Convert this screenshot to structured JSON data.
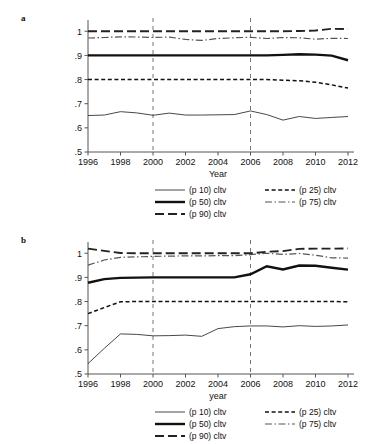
{
  "figure": {
    "panels": [
      {
        "letter": "a",
        "xlabel": "Year",
        "ylabel": "",
        "xticks": [
          "1996",
          "1998",
          "2000",
          "2002",
          "2004",
          "2006",
          "2008",
          "2010",
          "2012"
        ],
        "yticks": [
          "1",
          ".9",
          ".8",
          ".7",
          ".6",
          ".5"
        ]
      },
      {
        "letter": "b",
        "xlabel": "year",
        "ylabel": "",
        "xticks": [
          "1996",
          "1998",
          "2000",
          "2002",
          "2004",
          "2006",
          "2008",
          "2010",
          "2012"
        ],
        "yticks": [
          "1",
          ".9",
          ".8",
          ".7",
          ".6",
          ".5"
        ]
      }
    ],
    "legend": {
      "items": [
        {
          "label": "(p 10) cltv",
          "style": "thin-solid"
        },
        {
          "label": "(p 25) cltv",
          "style": "fine-dashed"
        },
        {
          "label": "(p 50) cltv",
          "style": "thick-solid"
        },
        {
          "label": "(p 75) cltv",
          "style": "dash-dot"
        },
        {
          "label": "(p 90) cltv",
          "style": "long-dash"
        }
      ]
    }
  },
  "chart_data": [
    {
      "type": "line",
      "panel": "a",
      "title": "",
      "xlabel": "Year",
      "ylabel": "",
      "xlim": [
        1996,
        2012
      ],
      "ylim": [
        0.5,
        1.03
      ],
      "yticks": [
        0.5,
        0.6,
        0.7,
        0.8,
        0.9,
        1.0
      ],
      "ytick_labels": [
        ".5",
        ".6",
        ".7",
        ".8",
        ".9",
        "1"
      ],
      "xticks": [
        1996,
        1998,
        2000,
        2002,
        2004,
        2006,
        2008,
        2010,
        2012
      ],
      "grid": false,
      "legend_position": "below",
      "annotations": [
        {
          "type": "vline",
          "x": 2000,
          "style": "dashed"
        },
        {
          "type": "vline",
          "x": 2006,
          "style": "dashed"
        }
      ],
      "x": [
        1996,
        1997,
        1998,
        1999,
        2000,
        2001,
        2002,
        2003,
        2004,
        2005,
        2006,
        2007,
        2008,
        2009,
        2010,
        2011,
        2012
      ],
      "series": [
        {
          "name": "(p 10) cltv",
          "values": [
            0.651,
            0.653,
            0.667,
            0.662,
            0.652,
            0.661,
            0.653,
            0.653,
            0.654,
            0.655,
            0.67,
            0.655,
            0.632,
            0.647,
            0.639,
            0.643,
            0.647
          ]
        },
        {
          "name": "(p 25) cltv",
          "values": [
            0.8,
            0.8,
            0.8,
            0.8,
            0.8,
            0.8,
            0.8,
            0.8,
            0.8,
            0.8,
            0.8,
            0.8,
            0.797,
            0.795,
            0.789,
            0.778,
            0.765
          ]
        },
        {
          "name": "(p 50) cltv",
          "values": [
            0.9,
            0.9,
            0.9,
            0.9,
            0.9,
            0.9,
            0.9,
            0.9,
            0.9,
            0.9,
            0.9,
            0.9,
            0.902,
            0.905,
            0.903,
            0.899,
            0.88
          ]
        },
        {
          "name": "(p 75) cltv",
          "values": [
            0.972,
            0.974,
            0.977,
            0.976,
            0.974,
            0.976,
            0.966,
            0.962,
            0.97,
            0.973,
            0.975,
            0.97,
            0.974,
            0.973,
            0.967,
            0.971,
            0.97
          ]
        },
        {
          "name": "(p 90) cltv",
          "values": [
            1.0,
            1.0,
            1.0,
            1.0,
            1.0,
            1.0,
            1.0,
            1.0,
            1.0,
            1.0,
            1.0,
            1.0,
            1.0,
            1.001,
            1.003,
            1.01,
            1.009
          ]
        }
      ]
    },
    {
      "type": "line",
      "panel": "b",
      "title": "",
      "xlabel": "year",
      "ylabel": "",
      "xlim": [
        1996,
        2012
      ],
      "ylim": [
        0.5,
        1.03
      ],
      "yticks": [
        0.5,
        0.6,
        0.7,
        0.8,
        0.9,
        1.0
      ],
      "ytick_labels": [
        ".5",
        ".6",
        ".7",
        ".8",
        ".9",
        "1"
      ],
      "xticks": [
        1996,
        1998,
        2000,
        2002,
        2004,
        2006,
        2008,
        2010,
        2012
      ],
      "grid": false,
      "legend_position": "below",
      "annotations": [
        {
          "type": "vline",
          "x": 2000,
          "style": "dashed"
        },
        {
          "type": "vline",
          "x": 2006,
          "style": "dashed"
        }
      ],
      "x": [
        1996,
        1997,
        1998,
        1999,
        2000,
        2001,
        2002,
        2003,
        2004,
        2005,
        2006,
        2007,
        2008,
        2009,
        2010,
        2011,
        2012
      ],
      "series": [
        {
          "name": "(p 10) cltv",
          "values": [
            0.543,
            0.606,
            0.666,
            0.664,
            0.658,
            0.659,
            0.661,
            0.656,
            0.688,
            0.696,
            0.699,
            0.699,
            0.695,
            0.7,
            0.697,
            0.699,
            0.703
          ]
        },
        {
          "name": "(p 25) cltv",
          "values": [
            0.75,
            0.775,
            0.799,
            0.8,
            0.8,
            0.8,
            0.8,
            0.8,
            0.8,
            0.8,
            0.8,
            0.8,
            0.8,
            0.8,
            0.8,
            0.8,
            0.799
          ]
        },
        {
          "name": "(p 50) cltv",
          "values": [
            0.878,
            0.893,
            0.898,
            0.899,
            0.9,
            0.9,
            0.9,
            0.9,
            0.9,
            0.9,
            0.913,
            0.946,
            0.933,
            0.949,
            0.948,
            0.94,
            0.932
          ]
        },
        {
          "name": "(p 75) cltv",
          "values": [
            0.951,
            0.972,
            0.983,
            0.985,
            0.987,
            0.988,
            0.989,
            0.989,
            0.99,
            0.99,
            0.994,
            1.0,
            0.995,
            0.999,
            0.992,
            0.981,
            0.98
          ]
        },
        {
          "name": "(p 90) cltv",
          "values": [
            1.019,
            1.01,
            1.001,
            1.0,
            1.0,
            1.0,
            1.0,
            1.0,
            1.0,
            1.0,
            1.0,
            1.006,
            1.009,
            1.018,
            1.019,
            1.019,
            1.02
          ]
        }
      ]
    }
  ]
}
